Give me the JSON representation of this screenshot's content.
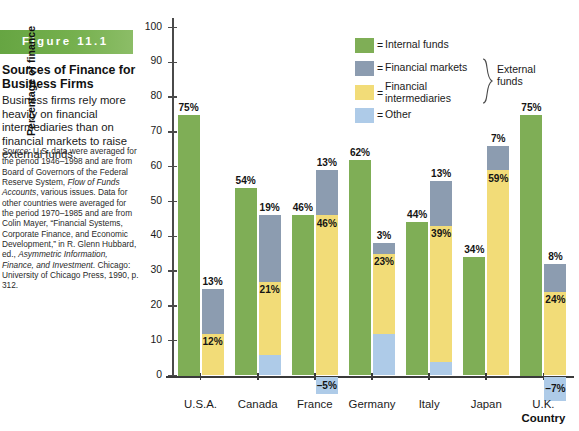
{
  "caption": {
    "figure_banner": "Figure  11.1",
    "title": "Sources of Finance for Business Firms",
    "body": "Business firms rely more heavily on financial intermediaries than on financial markets to raise external funds.",
    "source_label": "Source:",
    "source_text": " U.S. data were averaged for the period 1946–1998 and are from Board of Governors of the Federal Reserve System, ",
    "source_italic_1": "Flow of Funds Accounts",
    "source_text_2": ", various issues. Data for other countries were averaged for the period 1970–1985 and are from Colin Mayer, “Financial Systems, Corporate Finance, and Economic Development,” in R. Glenn Hubbard, ed., ",
    "source_italic_2": "Asymmetric Information, Finance, and Investment",
    "source_text_3": ". Chicago: University of Chicago Press, 1990, p. 312."
  },
  "legend": {
    "items": [
      {
        "label": "Internal funds",
        "color": "#7fae56",
        "eq": "="
      },
      {
        "label": "Financial markets",
        "color": "#8c9cb0",
        "eq": "="
      },
      {
        "label": "Financial\nintermediaries",
        "color": "#f2dc78",
        "eq": "="
      },
      {
        "label": "Other",
        "color": "#aecbe8",
        "eq": "="
      }
    ],
    "group_label": "External\nfunds"
  },
  "chart_data": {
    "type": "bar",
    "title": "Sources of Finance for Business Firms",
    "xlabel": "Country",
    "ylabel": "Percentage of finance",
    "ylim": [
      -10,
      100
    ],
    "yticks": [
      0,
      10,
      20,
      30,
      40,
      50,
      60,
      70,
      80,
      90,
      100
    ],
    "ytick_labels": [
      "0",
      "10",
      "20",
      "30",
      "40",
      "50",
      "60",
      "70",
      "80",
      "90",
      "100"
    ],
    "grid": false,
    "legend_position": "top-right",
    "categories": [
      "U.S.A.",
      "Canada",
      "France",
      "Germany",
      "Italy",
      "Japan",
      "U.K."
    ],
    "series": [
      {
        "name": "Internal funds",
        "color": "#7fae56",
        "values": [
          75,
          54,
          46,
          62,
          44,
          34,
          75
        ],
        "labels": [
          "75%",
          "54%",
          "46%",
          "62%",
          "44%",
          "34%",
          "75%"
        ]
      },
      {
        "name": "Financial markets",
        "color": "#8c9cb0",
        "values": [
          13,
          19,
          13,
          3,
          13,
          7,
          8
        ],
        "labels": [
          "13%",
          "19%",
          "13%",
          "3%",
          "13%",
          "7%",
          "8%"
        ]
      },
      {
        "name": "Financial intermediaries",
        "color": "#f2dc78",
        "values": [
          12,
          21,
          46,
          23,
          39,
          59,
          24
        ],
        "labels": [
          "12%",
          "21%",
          "46%",
          "23%",
          "39%",
          "59%",
          "24%"
        ]
      },
      {
        "name": "Other",
        "color": "#aecbe8",
        "values": [
          0,
          6,
          -5,
          12,
          4,
          0,
          -7
        ],
        "labels": [
          "",
          "6%",
          "–5%",
          "12%",
          "4%",
          "",
          "–7%"
        ]
      }
    ]
  }
}
